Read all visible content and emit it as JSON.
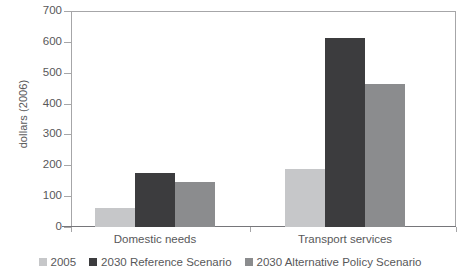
{
  "chart_data": {
    "type": "bar",
    "title": "",
    "subtitle": "",
    "xlabel": "",
    "ylabel": "dollars (2006)",
    "categories": [
      "Domestic needs",
      "Transport services"
    ],
    "series": [
      {
        "name": "2005",
        "color": "#c6c7c9",
        "values": [
          62,
          189
        ]
      },
      {
        "name": "2030 Reference Scenario",
        "color": "#3c3c3e",
        "values": [
          176,
          612
        ]
      },
      {
        "name": "2030 Alternative Policy Scenario",
        "color": "#8b8c8e",
        "values": [
          147,
          462
        ]
      }
    ],
    "ylim": [
      0,
      700
    ],
    "ytick_values": [
      0,
      100,
      200,
      300,
      400,
      500,
      600,
      700
    ],
    "ytick_labels": [
      "0",
      "100",
      "200",
      "300",
      "400",
      "500",
      "600",
      "700"
    ],
    "grid": false,
    "legend_position": "bottom"
  },
  "axes": {
    "y_title": "dollars (2006)"
  }
}
